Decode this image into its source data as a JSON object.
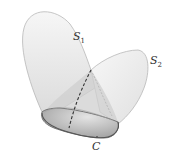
{
  "diagram": {
    "labels": {
      "s1": {
        "text": "S",
        "sub": "1"
      },
      "s2": {
        "text": "S",
        "sub": "2"
      },
      "c": {
        "text": "C"
      }
    },
    "colors": {
      "surface_fill": "#e8e8e8",
      "surface_stroke": "#b0b0b0",
      "base_fill": "#a8a8a8",
      "shadow_fill": "#c8c8c8",
      "dashed_curve": "#333333"
    }
  }
}
